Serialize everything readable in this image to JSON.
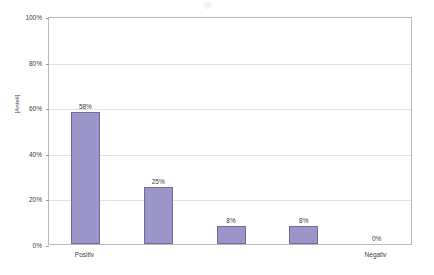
{
  "chart_data": {
    "type": "bar",
    "title": "",
    "subtitle": "",
    "xlabel": "",
    "ylabel": "[Anteil]",
    "categories": [
      "Positiv",
      "",
      "",
      "",
      "Negativ"
    ],
    "values": [
      58,
      25,
      8,
      8,
      0
    ],
    "value_labels": [
      "58%",
      "25%",
      "8%",
      "8%",
      "0%"
    ],
    "ylim": [
      0,
      100
    ],
    "yticks": [
      0,
      20,
      40,
      60,
      80,
      100
    ],
    "ytick_labels": [
      "0%",
      "20%",
      "40%",
      "60%",
      "80%",
      "100%"
    ],
    "grid": true,
    "grid_axis": "y",
    "legend": false,
    "legend_position": "none",
    "series": [
      {
        "name": "",
        "values": [
          58,
          25,
          8,
          8,
          0
        ],
        "color": "#9b95c9",
        "border_color": "#6f6b94"
      }
    ],
    "colors": {
      "bar_fill": "#9b95c9",
      "bar_border": "#6f6b94",
      "gridline": "#e2e2e2",
      "axis": "#b9b9b9",
      "text": "#3d3d3d",
      "background": "#ffffff"
    }
  }
}
